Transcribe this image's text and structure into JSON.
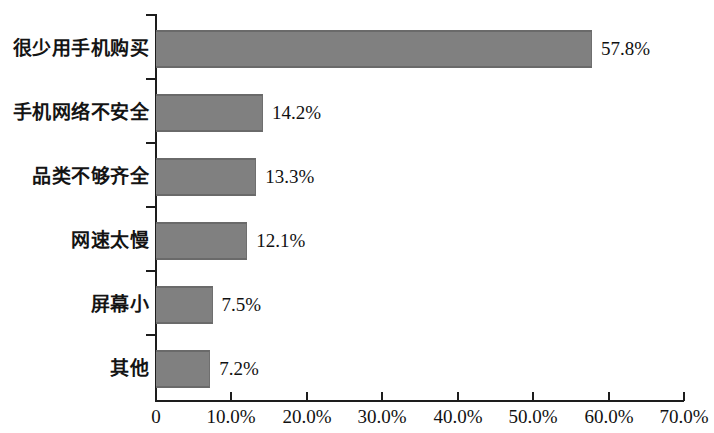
{
  "chart_data": {
    "type": "bar",
    "orientation": "horizontal",
    "title": "",
    "subtitle": "",
    "xlabel": "",
    "ylabel": "",
    "categories": [
      "很少用手机购买",
      "手机网络不安全",
      "品类不够齐全",
      "网速太慢",
      "屏幕小",
      "其他"
    ],
    "values": [
      57.8,
      14.2,
      13.3,
      12.1,
      7.5,
      7.2
    ],
    "value_labels": [
      "57.8%",
      "14.2%",
      "13.3%",
      "12.1%",
      "7.5%",
      "7.2%"
    ],
    "xlim": [
      0,
      70
    ],
    "xticks": [
      0,
      10,
      20,
      30,
      40,
      50,
      60,
      70
    ],
    "xtick_labels": [
      "0",
      "10.0%",
      "20.0%",
      "30.0%",
      "40.0%",
      "50.0%",
      "60.0%",
      "70.0%"
    ],
    "grid": false,
    "legend": null,
    "bar_color": "#808080",
    "bar_edge_color": "#6a6a6a",
    "axis_color": "#1d1d1d",
    "background_color": "#ffffff",
    "text_color": "#111111"
  }
}
